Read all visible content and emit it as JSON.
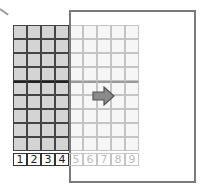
{
  "diagram": {
    "grid": {
      "cols": 9,
      "rows": 9,
      "cell_px": 14,
      "shaded_cols": 4,
      "thick_row_after": 4
    },
    "numbers": [
      "1",
      "2",
      "3",
      "4",
      "5",
      "6",
      "7",
      "8",
      "9"
    ],
    "colors": {
      "shaded": "#d4d4d4",
      "light": "#f6f6f6",
      "line_dark": "#444444",
      "line_light": "#c4c4c4",
      "arrow": "#8a8a8a",
      "paper_border": "#7a7a7a"
    },
    "arrow": {
      "direction": "right"
    }
  }
}
